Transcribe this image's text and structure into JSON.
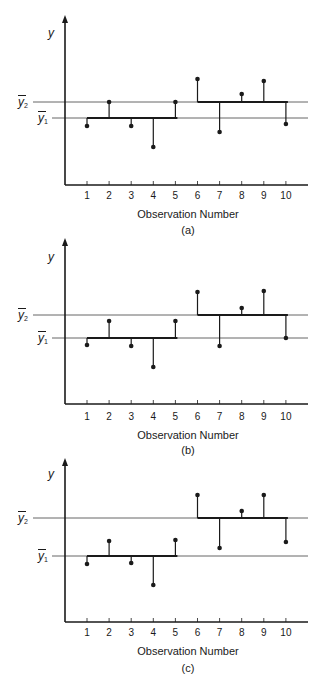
{
  "figure": {
    "panels": [
      {
        "id": "a",
        "caption": "(a)",
        "ylabel": "y",
        "xlabel": "Observation Number",
        "ybar2_label": "y",
        "ybar2_sub": "2",
        "ybar1_label": "y",
        "ybar1_sub": "1",
        "ticks": [
          "1",
          "2",
          "3",
          "4",
          "5",
          "6",
          "7",
          "8",
          "9",
          "10"
        ]
      },
      {
        "id": "b",
        "caption": "(b)",
        "ylabel": "y",
        "xlabel": "Observation Number",
        "ybar2_label": "y",
        "ybar2_sub": "2",
        "ybar1_label": "y",
        "ybar1_sub": "1",
        "ticks": [
          "1",
          "2",
          "3",
          "4",
          "5",
          "6",
          "7",
          "8",
          "9",
          "10"
        ]
      },
      {
        "id": "c",
        "caption": "(c)",
        "ylabel": "y",
        "xlabel": "Observation Number",
        "ybar2_label": "y",
        "ybar2_sub": "2",
        "ybar1_label": "y",
        "ybar1_sub": "1",
        "ticks": [
          "1",
          "2",
          "3",
          "4",
          "5",
          "6",
          "7",
          "8",
          "9",
          "10"
        ]
      }
    ],
    "colors": {
      "ink": "#1a1a1a",
      "mean_line": "#555555"
    }
  },
  "chart_data": [
    {
      "type": "scatter",
      "title": "(a)",
      "xlabel": "Observation Number",
      "ylabel": "y",
      "x": [
        1,
        2,
        3,
        4,
        5,
        6,
        7,
        8,
        9,
        10
      ],
      "values": [
        5.9,
        8.3,
        5.9,
        3.8,
        8.3,
        10.6,
        5.3,
        9.1,
        10.4,
        6.1
      ],
      "groups": [
        {
          "name": "group 1",
          "x": [
            1,
            2,
            3,
            4,
            5
          ],
          "mean_label": "ȳ1",
          "mean": 6.7
        },
        {
          "name": "group 2",
          "x": [
            6,
            7,
            8,
            9,
            10
          ],
          "mean_label": "ȳ2",
          "mean": 8.3
        }
      ],
      "reference_lines": [
        {
          "label": "ȳ2",
          "y": 8.3
        },
        {
          "label": "ȳ1",
          "y": 6.7
        }
      ],
      "ylim": [
        0,
        17
      ],
      "grid": false,
      "y_ticks_labeled": false
    },
    {
      "type": "scatter",
      "title": "(b)",
      "xlabel": "Observation Number",
      "ylabel": "y",
      "x": [
        1,
        2,
        3,
        4,
        5,
        6,
        7,
        8,
        9,
        10
      ],
      "values": [
        5.9,
        8.3,
        5.8,
        3.7,
        8.3,
        11.2,
        5.8,
        9.6,
        11.3,
        6.6
      ],
      "groups": [
        {
          "name": "group 1",
          "x": [
            1,
            2,
            3,
            4,
            5
          ],
          "mean_label": "ȳ1",
          "mean": 6.6
        },
        {
          "name": "group 2",
          "x": [
            6,
            7,
            8,
            9,
            10
          ],
          "mean_label": "ȳ2",
          "mean": 8.9
        }
      ],
      "reference_lines": [
        {
          "label": "ȳ2",
          "y": 8.9
        },
        {
          "label": "ȳ1",
          "y": 6.6
        }
      ],
      "ylim": [
        0,
        16.6
      ],
      "grid": false,
      "y_ticks_labeled": false
    },
    {
      "type": "scatter",
      "title": "(c)",
      "xlabel": "Observation Number",
      "ylabel": "y",
      "x": [
        1,
        2,
        3,
        4,
        5,
        6,
        7,
        8,
        9,
        10
      ],
      "values": [
        5.8,
        8.1,
        5.9,
        3.7,
        8.2,
        12.7,
        7.4,
        11.1,
        12.7,
        8.0
      ],
      "groups": [
        {
          "name": "group 1",
          "x": [
            1,
            2,
            3,
            4,
            5
          ],
          "mean_label": "ȳ1",
          "mean": 6.6
        },
        {
          "name": "group 2",
          "x": [
            6,
            7,
            8,
            9,
            10
          ],
          "mean_label": "ȳ2",
          "mean": 10.4
        }
      ],
      "reference_lines": [
        {
          "label": "ȳ2",
          "y": 10.4
        },
        {
          "label": "ȳ1",
          "y": 6.6
        }
      ],
      "ylim": [
        0,
        16.4
      ],
      "grid": false,
      "y_ticks_labeled": false
    }
  ]
}
